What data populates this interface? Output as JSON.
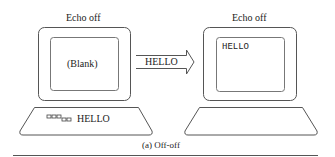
{
  "left_terminal": {
    "title": "Echo off",
    "screen_text": "(Blank)",
    "keyboard_text": "HELLO"
  },
  "transmission": {
    "label": "HELLO"
  },
  "right_terminal": {
    "title": "Echo off",
    "screen_text": "HELLO"
  },
  "caption": "(a) Off-off",
  "colors": {
    "stroke": "#555555",
    "text": "#222222",
    "background": "#ffffff"
  }
}
